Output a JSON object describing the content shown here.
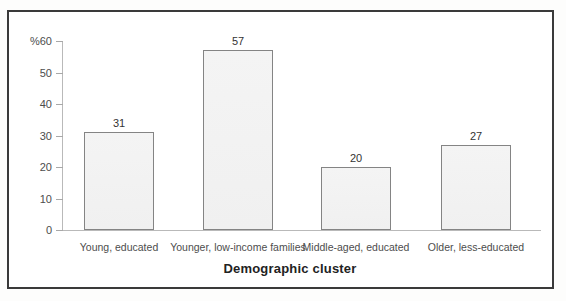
{
  "chart_data": {
    "type": "bar",
    "title": "",
    "xlabel": "Demographic cluster",
    "ylabel": "%",
    "ylim": [
      0,
      60
    ],
    "yticks": [
      0,
      10,
      20,
      30,
      40,
      50,
      60
    ],
    "categories": [
      "Young, educated",
      "Younger, low-income families",
      "Middle-aged, educated",
      "Older, less-educated"
    ],
    "values": [
      31,
      57,
      20,
      27
    ],
    "grid": "off",
    "legend": "none",
    "colors": {
      "bar_fill": "#f3f3f3",
      "bar_border": "#848484",
      "axis_line": "#b9b9b9",
      "tick_text": "#4d4d4d",
      "frame_border": "#3a3a3a"
    }
  }
}
